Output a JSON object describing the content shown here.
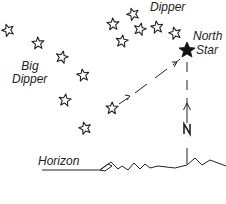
{
  "labels": {
    "little_dipper": "Dipper",
    "big_dipper_line1": "Big",
    "big_dipper_line2": "Dipper",
    "north_star_line1": "North",
    "north_star_line2": "Star",
    "horizon": "Horizon",
    "north_marker": "N"
  },
  "colors": {
    "ink": "#222222",
    "background": "#ffffff"
  },
  "big_dipper_stars": [
    {
      "x": 8,
      "y": 30
    },
    {
      "x": 38,
      "y": 43
    },
    {
      "x": 62,
      "y": 57
    },
    {
      "x": 83,
      "y": 75
    },
    {
      "x": 65,
      "y": 100
    },
    {
      "x": 85,
      "y": 128
    },
    {
      "x": 112,
      "y": 108
    }
  ],
  "little_dipper_stars": [
    {
      "x": 133,
      "y": 14
    },
    {
      "x": 113,
      "y": 24
    },
    {
      "x": 140,
      "y": 29
    },
    {
      "x": 157,
      "y": 27
    },
    {
      "x": 122,
      "y": 41
    },
    {
      "x": 175,
      "y": 33
    }
  ],
  "north_star": {
    "x": 187,
    "y": 50
  }
}
